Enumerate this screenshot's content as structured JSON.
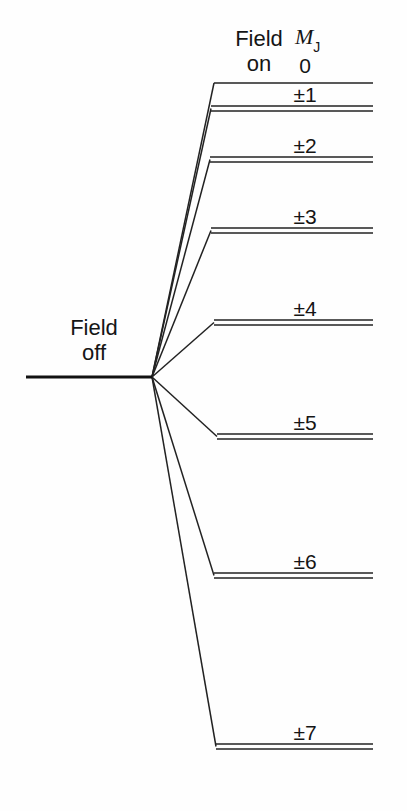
{
  "figure": {
    "type": "energy-level-diagram",
    "background_color": "#fefefe",
    "line_color": "#222222"
  },
  "labels": {
    "field_on": "Field\non",
    "field_off": "Field\noff",
    "quantum_number_symbol": "M",
    "quantum_number_subscript": "J"
  },
  "field_off_level": {
    "name": "field-off-level",
    "x_start": 26,
    "x_end": 152,
    "y": 377,
    "stroke_width": 3.2
  },
  "convergence_point": {
    "x": 152,
    "y": 377
  },
  "levels": [
    {
      "label": "0",
      "mj": 0,
      "y_top": 83,
      "y_bottom": 83,
      "x_left": 214,
      "x_right": 373,
      "doubled": false,
      "label_x": 305,
      "label_y": 55
    },
    {
      "label": "±1",
      "mj": 1,
      "y_top": 106,
      "y_bottom": 111,
      "x_left": 211,
      "x_right": 373,
      "doubled": true,
      "label_x": 305,
      "label_y": 84
    },
    {
      "label": "±2",
      "mj": 2,
      "y_top": 157,
      "y_bottom": 162,
      "x_left": 210,
      "x_right": 373,
      "doubled": true,
      "label_x": 305,
      "label_y": 135
    },
    {
      "label": "±3",
      "mj": 3,
      "y_top": 228,
      "y_bottom": 233,
      "x_left": 211,
      "x_right": 373,
      "doubled": true,
      "label_x": 305,
      "label_y": 206
    },
    {
      "label": "±4",
      "mj": 4,
      "y_top": 320,
      "y_bottom": 325,
      "x_left": 214,
      "x_right": 373,
      "doubled": true,
      "label_x": 305,
      "label_y": 298
    },
    {
      "label": "±5",
      "mj": 5,
      "y_top": 434,
      "y_bottom": 439,
      "x_left": 217,
      "x_right": 373,
      "doubled": true,
      "label_x": 305,
      "label_y": 412
    },
    {
      "label": "±6",
      "mj": 6,
      "y_top": 573,
      "y_bottom": 578,
      "x_left": 214,
      "x_right": 373,
      "doubled": true,
      "label_x": 305,
      "label_y": 551
    },
    {
      "label": "±7",
      "mj": 7,
      "y_top": 744,
      "y_bottom": 749,
      "x_left": 216,
      "x_right": 373,
      "doubled": true,
      "label_x": 305,
      "label_y": 722
    }
  ],
  "chart_data": {
    "type": "line",
    "title": "",
    "xlabel": "",
    "ylabel": "",
    "categories": [
      "0",
      "±1",
      "±2",
      "±3",
      "±4",
      "±5",
      "±6",
      "±7"
    ],
    "values": [
      83,
      108.5,
      159.5,
      230.5,
      322.5,
      436.5,
      575.5,
      746.5
    ],
    "note": "y pixel centers of each split level; lower pixel y = higher on page",
    "legend": []
  }
}
